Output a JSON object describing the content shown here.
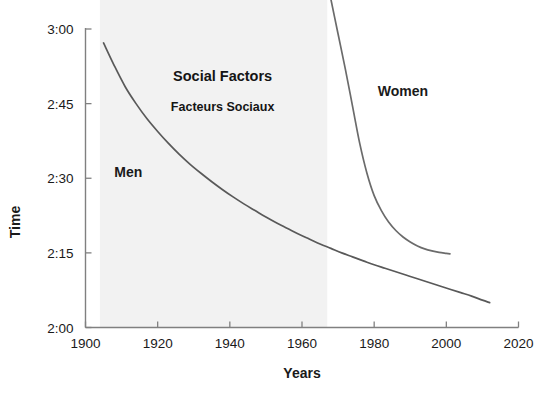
{
  "chart_data": {
    "type": "line",
    "title": "",
    "xlabel": "Years",
    "ylabel": "Time",
    "xlim": [
      1900,
      2020
    ],
    "ylim": [
      120,
      180
    ],
    "grid": false,
    "legend": "inline-annotations",
    "x_ticks": [
      {
        "value": 1900,
        "label": "1900"
      },
      {
        "value": 1920,
        "label": "1920"
      },
      {
        "value": 1940,
        "label": "1940"
      },
      {
        "value": 1960,
        "label": "1960"
      },
      {
        "value": 1980,
        "label": "1980"
      },
      {
        "value": 2000,
        "label": "2000"
      },
      {
        "value": 2020,
        "label": "2020"
      }
    ],
    "y_ticks": [
      {
        "value": 120,
        "label": "2:00"
      },
      {
        "value": 135,
        "label": "2:15"
      },
      {
        "value": 150,
        "label": "2:30"
      },
      {
        "value": 165,
        "label": "2:45"
      },
      {
        "value": 180,
        "label": "3:00"
      }
    ],
    "series": [
      {
        "name": "Men",
        "color": "#595959",
        "label_x": 1908,
        "label_y": 150.2,
        "points": [
          {
            "x": 1905,
            "y": 177.2
          },
          {
            "x": 1908,
            "y": 172.6
          },
          {
            "x": 1911,
            "y": 168.4
          },
          {
            "x": 1914,
            "y": 165.0
          },
          {
            "x": 1917,
            "y": 162.0
          },
          {
            "x": 1920,
            "y": 159.4
          },
          {
            "x": 1923,
            "y": 157.0
          },
          {
            "x": 1926,
            "y": 154.8
          },
          {
            "x": 1929,
            "y": 152.8
          },
          {
            "x": 1932,
            "y": 151.0
          },
          {
            "x": 1935,
            "y": 149.3
          },
          {
            "x": 1938,
            "y": 147.7
          },
          {
            "x": 1941,
            "y": 146.2
          },
          {
            "x": 1944,
            "y": 144.8
          },
          {
            "x": 1947,
            "y": 143.5
          },
          {
            "x": 1950,
            "y": 142.2
          },
          {
            "x": 1953,
            "y": 141.0
          },
          {
            "x": 1956,
            "y": 139.9
          },
          {
            "x": 1959,
            "y": 138.8
          },
          {
            "x": 1962,
            "y": 137.8
          },
          {
            "x": 1965,
            "y": 136.8
          },
          {
            "x": 1968,
            "y": 135.9
          },
          {
            "x": 1971,
            "y": 135.0
          },
          {
            "x": 1974,
            "y": 134.2
          },
          {
            "x": 1977,
            "y": 133.4
          },
          {
            "x": 1980,
            "y": 132.6
          },
          {
            "x": 1983,
            "y": 131.9
          },
          {
            "x": 1986,
            "y": 131.2
          },
          {
            "x": 1989,
            "y": 130.5
          },
          {
            "x": 1992,
            "y": 129.8
          },
          {
            "x": 1995,
            "y": 129.1
          },
          {
            "x": 1998,
            "y": 128.4
          },
          {
            "x": 2001,
            "y": 127.7
          },
          {
            "x": 2004,
            "y": 127.0
          },
          {
            "x": 2007,
            "y": 126.3
          },
          {
            "x": 2010,
            "y": 125.5
          },
          {
            "x": 2012,
            "y": 125.0
          }
        ]
      },
      {
        "name": "Women",
        "color": "#6b6b6b",
        "label_x": 1981,
        "label_y": 166.5,
        "points": [
          {
            "x": 1966,
            "y": 193.0
          },
          {
            "x": 1968,
            "y": 186.0
          },
          {
            "x": 1970,
            "y": 179.0
          },
          {
            "x": 1972,
            "y": 172.0
          },
          {
            "x": 1974,
            "y": 164.5
          },
          {
            "x": 1976,
            "y": 157.0
          },
          {
            "x": 1978,
            "y": 151.0
          },
          {
            "x": 1980,
            "y": 146.5
          },
          {
            "x": 1982,
            "y": 143.5
          },
          {
            "x": 1984,
            "y": 141.2
          },
          {
            "x": 1986,
            "y": 139.5
          },
          {
            "x": 1988,
            "y": 138.2
          },
          {
            "x": 1990,
            "y": 137.2
          },
          {
            "x": 1992,
            "y": 136.4
          },
          {
            "x": 1994,
            "y": 135.8
          },
          {
            "x": 1996,
            "y": 135.4
          },
          {
            "x": 1998,
            "y": 135.1
          },
          {
            "x": 2000,
            "y": 134.9
          },
          {
            "x": 2001,
            "y": 134.8
          }
        ]
      }
    ],
    "shaded_region": {
      "x_start": 1904,
      "x_end": 1967,
      "color": "#f2f2f2",
      "label_en": "Social Factors",
      "label_fr": "Facteurs Sociaux",
      "label_en_x": 1938,
      "label_en_y": 169.5,
      "label_fr_x": 1938,
      "label_fr_y": 163.5
    },
    "axis_color": "#808080"
  }
}
